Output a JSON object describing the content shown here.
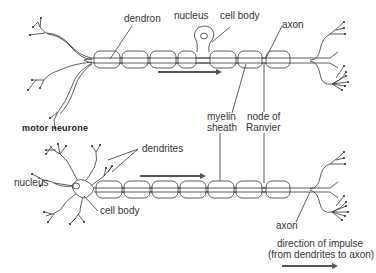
{
  "diagram": {
    "type": "neurone-structure",
    "colors": {
      "line": "#333333",
      "arrow": "#555555",
      "background": "#ffffff"
    },
    "motor_neurone": {
      "title": "motor neurone",
      "labels": {
        "dendron": "dendron",
        "nucleus": "nucleus",
        "cell_body": "cell body",
        "axon": "axon",
        "myelin_sheath_line1": "myelin",
        "myelin_sheath_line2": "sheath",
        "node_of_ranvier_line1": "node of",
        "node_of_ranvier_line2": "Ranvier"
      }
    },
    "second_neurone": {
      "labels": {
        "dendrites": "dendrites",
        "nucleus": "nucleus",
        "cell_body": "cell body",
        "axon": "axon"
      }
    },
    "legend": {
      "line1": "direction of impulse",
      "line2": "(from dendrites to axon)",
      "icon": "right-arrow-icon"
    }
  }
}
